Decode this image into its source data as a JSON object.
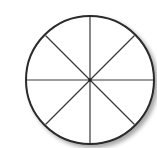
{
  "diagram": {
    "type": "circle-divided",
    "shape": "circle",
    "sections": 8,
    "divisions": "8 equal sectors by 4 lines through center (horizontal, vertical, two diagonals)",
    "center": [
      90,
      80
    ],
    "radius": 64,
    "stroke_color": "#2a2a2a",
    "line_color": "#3a3a3a",
    "fill_color": "#ffffff",
    "shadow_color": "#c8c8c8",
    "title": ""
  }
}
